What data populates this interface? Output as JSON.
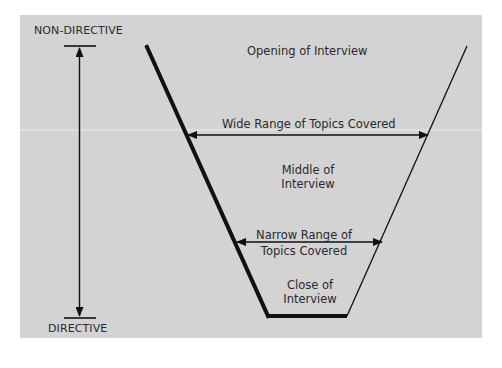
{
  "diagram": {
    "colors": {
      "background": "#ffffff",
      "panel": "#d3d3d3",
      "line": "#111111",
      "text": "#2a2a2a"
    },
    "scale": {
      "top_label": "NON-DIRECTIVE",
      "bottom_label": "DIRECTIVE"
    },
    "funnel": {
      "opening": "Opening of Interview",
      "wide_range": "Wide Range of Topics Covered",
      "middle_line1": "Middle of",
      "middle_line2": "Interview",
      "narrow_line1": "Narrow Range of",
      "narrow_line2": "Topics  Covered",
      "close_line1": "Close of",
      "close_line2": "Interview"
    }
  }
}
